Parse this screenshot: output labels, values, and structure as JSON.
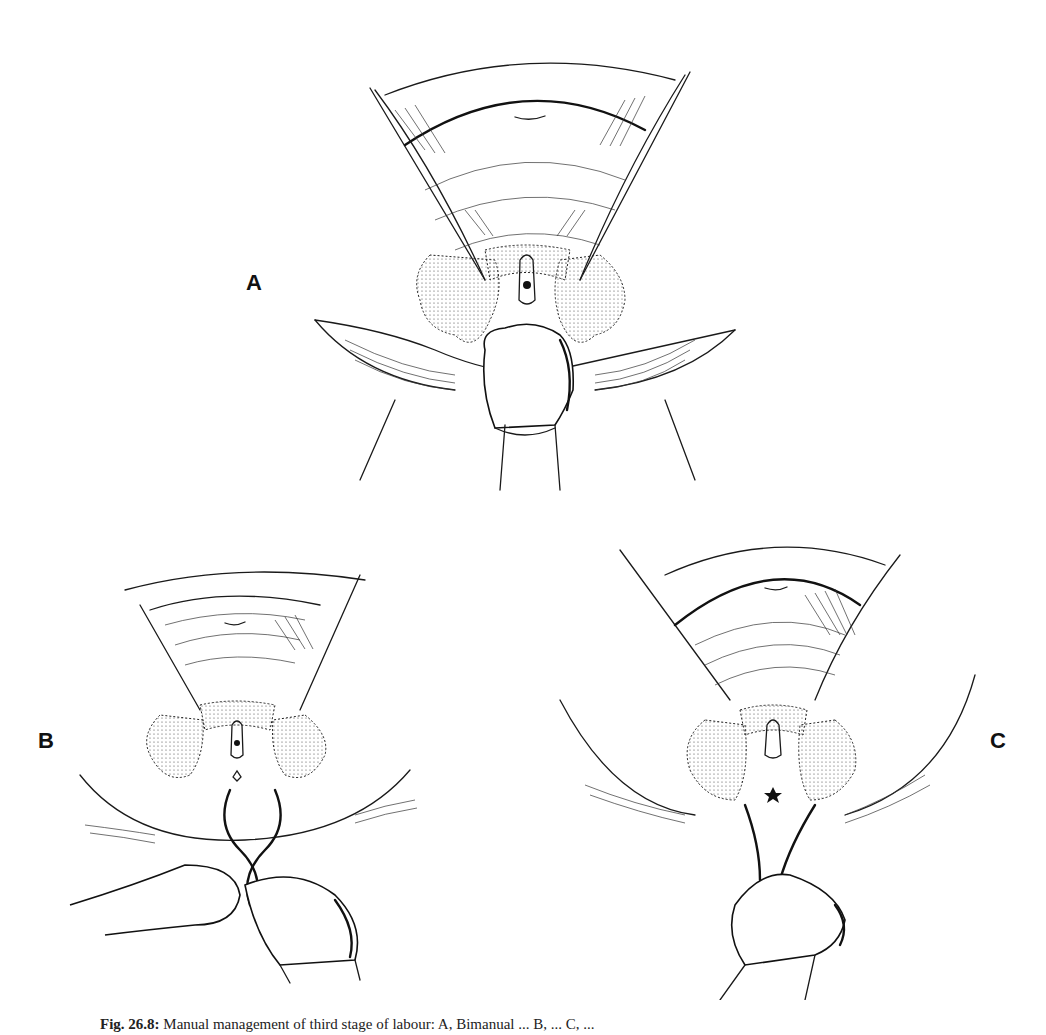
{
  "figure": {
    "panels": [
      {
        "id": "A",
        "label": "A",
        "description": "bimanual-hand-pressure"
      },
      {
        "id": "B",
        "label": "B",
        "description": "two-hands-with-forceps"
      },
      {
        "id": "C",
        "label": "C",
        "description": "one-hand-with-instrument"
      }
    ],
    "caption": {
      "number": "Fig. 26.8:",
      "text": "Manual management of third stage of labour: A, Bimanual ... B, ... C, ..."
    }
  }
}
